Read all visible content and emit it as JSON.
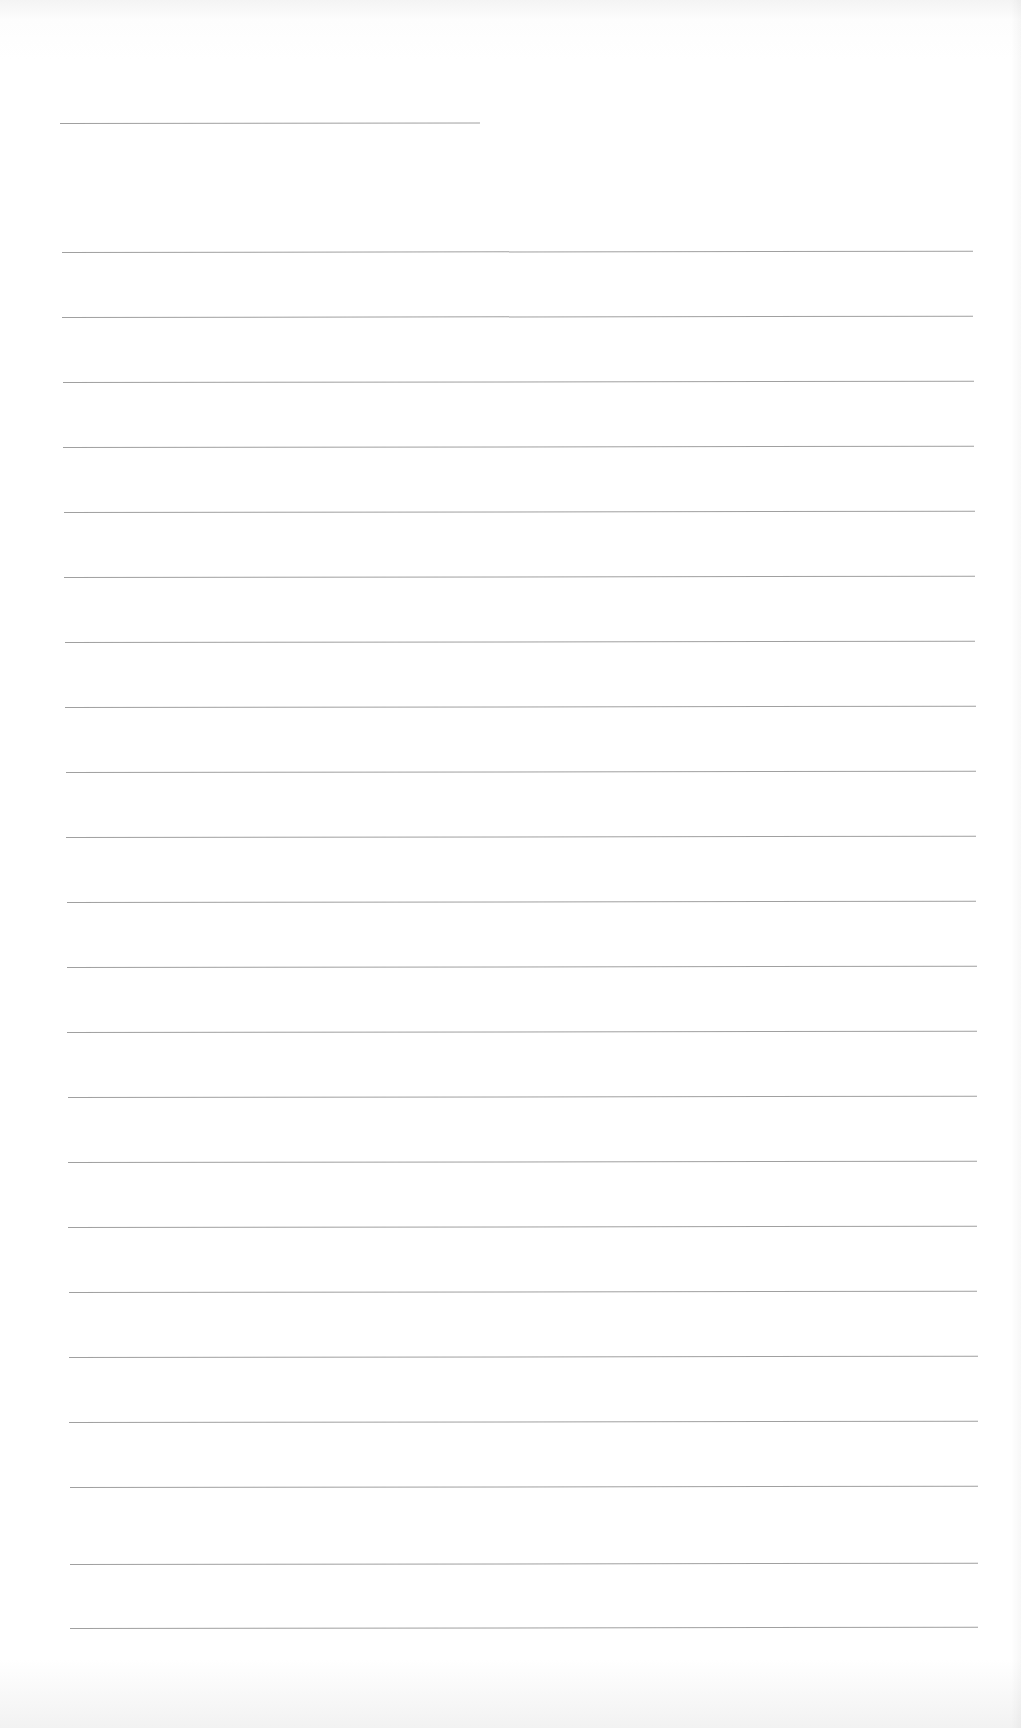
{
  "document": {
    "type": "lined-paper",
    "background_color": "#ffffff",
    "line_color": "#8f8f8f",
    "header_line": {
      "x1": 60,
      "x2": 480,
      "y": 123
    },
    "lines": [
      {
        "y": 252,
        "x1": 62,
        "x2": 973
      },
      {
        "y": 317,
        "x1": 62,
        "x2": 973
      },
      {
        "y": 382,
        "x1": 63,
        "x2": 974
      },
      {
        "y": 447,
        "x1": 63,
        "x2": 974
      },
      {
        "y": 512,
        "x1": 64,
        "x2": 975
      },
      {
        "y": 577,
        "x1": 64,
        "x2": 975
      },
      {
        "y": 642,
        "x1": 65,
        "x2": 975
      },
      {
        "y": 707,
        "x1": 65,
        "x2": 976
      },
      {
        "y": 772,
        "x1": 66,
        "x2": 976
      },
      {
        "y": 837,
        "x1": 66,
        "x2": 976
      },
      {
        "y": 902,
        "x1": 67,
        "x2": 976
      },
      {
        "y": 967,
        "x1": 67,
        "x2": 977
      },
      {
        "y": 1032,
        "x1": 67,
        "x2": 977
      },
      {
        "y": 1097,
        "x1": 68,
        "x2": 977
      },
      {
        "y": 1162,
        "x1": 68,
        "x2": 977
      },
      {
        "y": 1227,
        "x1": 68,
        "x2": 977
      },
      {
        "y": 1292,
        "x1": 69,
        "x2": 977
      },
      {
        "y": 1357,
        "x1": 69,
        "x2": 978
      },
      {
        "y": 1422,
        "x1": 69,
        "x2": 978
      },
      {
        "y": 1487,
        "x1": 70,
        "x2": 978
      },
      {
        "y": 1564,
        "x1": 70,
        "x2": 978
      },
      {
        "y": 1628,
        "x1": 70,
        "x2": 978
      }
    ]
  }
}
